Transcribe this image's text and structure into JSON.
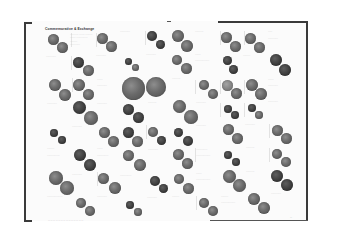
{
  "page": {
    "title": "Commemorative & Exchange",
    "footer": "— — — — — — — — — — — — — —",
    "page_number": "—"
  },
  "coins": [
    {
      "x": 48,
      "y": 34,
      "d": 11,
      "tone": "mid"
    },
    {
      "x": 57,
      "y": 42,
      "d": 11,
      "tone": "mid"
    },
    {
      "x": 97,
      "y": 33,
      "d": 11,
      "tone": "mid"
    },
    {
      "x": 106,
      "y": 41,
      "d": 11,
      "tone": "mid"
    },
    {
      "x": 147,
      "y": 31,
      "d": 10,
      "tone": "dark"
    },
    {
      "x": 156,
      "y": 40,
      "d": 9,
      "tone": "dark"
    },
    {
      "x": 172,
      "y": 30,
      "d": 12,
      "tone": "mid"
    },
    {
      "x": 181,
      "y": 40,
      "d": 12,
      "tone": "mid"
    },
    {
      "x": 221,
      "y": 32,
      "d": 11,
      "tone": "mid"
    },
    {
      "x": 230,
      "y": 41,
      "d": 11,
      "tone": "mid"
    },
    {
      "x": 245,
      "y": 33,
      "d": 11,
      "tone": "mid"
    },
    {
      "x": 254,
      "y": 42,
      "d": 11,
      "tone": "mid"
    },
    {
      "x": 73,
      "y": 57,
      "d": 11,
      "tone": "dark"
    },
    {
      "x": 83,
      "y": 65,
      "d": 11,
      "tone": "mid"
    },
    {
      "x": 125,
      "y": 58,
      "d": 7,
      "tone": "dark"
    },
    {
      "x": 132,
      "y": 64,
      "d": 7,
      "tone": "mid"
    },
    {
      "x": 172,
      "y": 55,
      "d": 10,
      "tone": "mid"
    },
    {
      "x": 181,
      "y": 63,
      "d": 11,
      "tone": "mid"
    },
    {
      "x": 223,
      "y": 56,
      "d": 9,
      "tone": "dark"
    },
    {
      "x": 229,
      "y": 65,
      "d": 9,
      "tone": "dark"
    },
    {
      "x": 270,
      "y": 54,
      "d": 12,
      "tone": "dark"
    },
    {
      "x": 279,
      "y": 64,
      "d": 12,
      "tone": "dark"
    },
    {
      "x": 49,
      "y": 79,
      "d": 12,
      "tone": "mid"
    },
    {
      "x": 59,
      "y": 89,
      "d": 12,
      "tone": "mid"
    },
    {
      "x": 73,
      "y": 79,
      "d": 12,
      "tone": "mid"
    },
    {
      "x": 83,
      "y": 89,
      "d": 11,
      "tone": "mid"
    },
    {
      "x": 122,
      "y": 77,
      "d": 23,
      "tone": "mid"
    },
    {
      "x": 146,
      "y": 77,
      "d": 20,
      "tone": "mid"
    },
    {
      "x": 199,
      "y": 80,
      "d": 10,
      "tone": "mid"
    },
    {
      "x": 208,
      "y": 89,
      "d": 10,
      "tone": "mid"
    },
    {
      "x": 222,
      "y": 80,
      "d": 11,
      "tone": "light"
    },
    {
      "x": 231,
      "y": 88,
      "d": 11,
      "tone": "mid"
    },
    {
      "x": 246,
      "y": 79,
      "d": 12,
      "tone": "mid"
    },
    {
      "x": 255,
      "y": 88,
      "d": 12,
      "tone": "mid"
    },
    {
      "x": 73,
      "y": 101,
      "d": 13,
      "tone": "dark"
    },
    {
      "x": 84,
      "y": 111,
      "d": 14,
      "tone": "mid"
    },
    {
      "x": 123,
      "y": 104,
      "d": 11,
      "tone": "dark"
    },
    {
      "x": 133,
      "y": 112,
      "d": 11,
      "tone": "dark"
    },
    {
      "x": 173,
      "y": 100,
      "d": 13,
      "tone": "mid"
    },
    {
      "x": 184,
      "y": 110,
      "d": 14,
      "tone": "mid"
    },
    {
      "x": 224,
      "y": 105,
      "d": 8,
      "tone": "dark"
    },
    {
      "x": 231,
      "y": 111,
      "d": 8,
      "tone": "dark"
    },
    {
      "x": 248,
      "y": 104,
      "d": 8,
      "tone": "dark"
    },
    {
      "x": 255,
      "y": 111,
      "d": 8,
      "tone": "mid"
    },
    {
      "x": 50,
      "y": 129,
      "d": 8,
      "tone": "dark"
    },
    {
      "x": 58,
      "y": 136,
      "d": 8,
      "tone": "dark"
    },
    {
      "x": 99,
      "y": 127,
      "d": 11,
      "tone": "mid"
    },
    {
      "x": 108,
      "y": 136,
      "d": 11,
      "tone": "mid"
    },
    {
      "x": 123,
      "y": 127,
      "d": 11,
      "tone": "dark"
    },
    {
      "x": 132,
      "y": 136,
      "d": 11,
      "tone": "mid"
    },
    {
      "x": 148,
      "y": 127,
      "d": 10,
      "tone": "mid"
    },
    {
      "x": 157,
      "y": 136,
      "d": 9,
      "tone": "dark"
    },
    {
      "x": 174,
      "y": 128,
      "d": 9,
      "tone": "dark"
    },
    {
      "x": 183,
      "y": 136,
      "d": 10,
      "tone": "dark"
    },
    {
      "x": 223,
      "y": 124,
      "d": 11,
      "tone": "mid"
    },
    {
      "x": 232,
      "y": 133,
      "d": 11,
      "tone": "mid"
    },
    {
      "x": 272,
      "y": 125,
      "d": 11,
      "tone": "mid"
    },
    {
      "x": 281,
      "y": 133,
      "d": 11,
      "tone": "mid"
    },
    {
      "x": 74,
      "y": 149,
      "d": 12,
      "tone": "dark"
    },
    {
      "x": 84,
      "y": 159,
      "d": 12,
      "tone": "dark"
    },
    {
      "x": 123,
      "y": 150,
      "d": 11,
      "tone": "mid"
    },
    {
      "x": 134,
      "y": 159,
      "d": 12,
      "tone": "mid"
    },
    {
      "x": 173,
      "y": 149,
      "d": 11,
      "tone": "mid"
    },
    {
      "x": 182,
      "y": 158,
      "d": 11,
      "tone": "mid"
    },
    {
      "x": 224,
      "y": 151,
      "d": 8,
      "tone": "dark"
    },
    {
      "x": 232,
      "y": 158,
      "d": 8,
      "tone": "dark"
    },
    {
      "x": 272,
      "y": 149,
      "d": 10,
      "tone": "mid"
    },
    {
      "x": 281,
      "y": 157,
      "d": 10,
      "tone": "mid"
    },
    {
      "x": 49,
      "y": 171,
      "d": 14,
      "tone": "mid"
    },
    {
      "x": 60,
      "y": 181,
      "d": 14,
      "tone": "mid"
    },
    {
      "x": 98,
      "y": 173,
      "d": 11,
      "tone": "mid"
    },
    {
      "x": 109,
      "y": 182,
      "d": 12,
      "tone": "mid"
    },
    {
      "x": 150,
      "y": 176,
      "d": 10,
      "tone": "dark"
    },
    {
      "x": 159,
      "y": 184,
      "d": 9,
      "tone": "dark"
    },
    {
      "x": 174,
      "y": 174,
      "d": 10,
      "tone": "mid"
    },
    {
      "x": 183,
      "y": 183,
      "d": 11,
      "tone": "mid"
    },
    {
      "x": 223,
      "y": 170,
      "d": 13,
      "tone": "mid"
    },
    {
      "x": 233,
      "y": 179,
      "d": 13,
      "tone": "mid"
    },
    {
      "x": 271,
      "y": 170,
      "d": 12,
      "tone": "dark"
    },
    {
      "x": 281,
      "y": 179,
      "d": 12,
      "tone": "dark"
    },
    {
      "x": 76,
      "y": 198,
      "d": 10,
      "tone": "mid"
    },
    {
      "x": 85,
      "y": 206,
      "d": 10,
      "tone": "mid"
    },
    {
      "x": 126,
      "y": 201,
      "d": 8,
      "tone": "dark"
    },
    {
      "x": 134,
      "y": 208,
      "d": 8,
      "tone": "mid"
    },
    {
      "x": 199,
      "y": 198,
      "d": 10,
      "tone": "mid"
    },
    {
      "x": 208,
      "y": 206,
      "d": 10,
      "tone": "mid"
    },
    {
      "x": 248,
      "y": 193,
      "d": 12,
      "tone": "mid"
    },
    {
      "x": 258,
      "y": 202,
      "d": 12,
      "tone": "mid"
    }
  ],
  "labels": [
    {
      "x": 70,
      "y": 33,
      "text": "────── ──── ─────"
    },
    {
      "x": 70,
      "y": 36,
      "text": "──── ────────"
    },
    {
      "x": 70,
      "y": 40,
      "text": "─────"
    },
    {
      "x": 70,
      "y": 43,
      "text": "───────"
    },
    {
      "x": 46,
      "y": 55,
      "text": "───────"
    },
    {
      "x": 96,
      "y": 54,
      "text": "───────"
    },
    {
      "x": 120,
      "y": 30,
      "text": "───────"
    },
    {
      "x": 146,
      "y": 53,
      "text": "───────"
    },
    {
      "x": 195,
      "y": 30,
      "text": "──────"
    },
    {
      "x": 195,
      "y": 53,
      "text": "────"
    },
    {
      "x": 195,
      "y": 59,
      "text": "──────────"
    },
    {
      "x": 243,
      "y": 54,
      "text": "─────"
    },
    {
      "x": 268,
      "y": 30,
      "text": "───"
    },
    {
      "x": 268,
      "y": 37,
      "text": "───────"
    },
    {
      "x": 172,
      "y": 77,
      "text": "──────"
    },
    {
      "x": 97,
      "y": 78,
      "text": "────"
    },
    {
      "x": 97,
      "y": 84,
      "text": "───────"
    },
    {
      "x": 268,
      "y": 78,
      "text": "────"
    },
    {
      "x": 268,
      "y": 84,
      "text": "───────"
    },
    {
      "x": 47,
      "y": 102,
      "text": "───────"
    },
    {
      "x": 97,
      "y": 102,
      "text": "───────"
    },
    {
      "x": 148,
      "y": 101,
      "text": "──────"
    },
    {
      "x": 196,
      "y": 101,
      "text": "───────"
    },
    {
      "x": 268,
      "y": 100,
      "text": "───────"
    },
    {
      "x": 72,
      "y": 125,
      "text": "───────"
    },
    {
      "x": 196,
      "y": 124,
      "text": "───────"
    },
    {
      "x": 245,
      "y": 123,
      "text": "───────"
    },
    {
      "x": 47,
      "y": 147,
      "text": "─────"
    },
    {
      "x": 47,
      "y": 154,
      "text": "─────────"
    },
    {
      "x": 97,
      "y": 147,
      "text": "────"
    },
    {
      "x": 97,
      "y": 154,
      "text": "────────"
    },
    {
      "x": 148,
      "y": 148,
      "text": "───────"
    },
    {
      "x": 196,
      "y": 148,
      "text": "────────"
    },
    {
      "x": 196,
      "y": 154,
      "text": "──────────"
    },
    {
      "x": 246,
      "y": 146,
      "text": "──────"
    },
    {
      "x": 72,
      "y": 173,
      "text": "───────"
    },
    {
      "x": 120,
      "y": 174,
      "text": "────────"
    },
    {
      "x": 196,
      "y": 172,
      "text": "────"
    },
    {
      "x": 196,
      "y": 178,
      "text": "──────────"
    },
    {
      "x": 246,
      "y": 170,
      "text": "──────"
    },
    {
      "x": 47,
      "y": 195,
      "text": "───────────"
    },
    {
      "x": 97,
      "y": 195,
      "text": "───────"
    },
    {
      "x": 147,
      "y": 196,
      "text": "───────"
    },
    {
      "x": 172,
      "y": 195,
      "text": "─────"
    },
    {
      "x": 221,
      "y": 195,
      "text": "─────"
    },
    {
      "x": 221,
      "y": 201,
      "text": "──────────"
    },
    {
      "x": 271,
      "y": 192,
      "text": "───────"
    }
  ],
  "separators": [
    {
      "x": 71,
      "y": 33,
      "h": 14
    },
    {
      "x": 96,
      "y": 33,
      "h": 14
    },
    {
      "x": 145,
      "y": 31,
      "h": 14
    },
    {
      "x": 220,
      "y": 31,
      "h": 14
    },
    {
      "x": 244,
      "y": 31,
      "h": 14
    },
    {
      "x": 71,
      "y": 56,
      "h": 14
    },
    {
      "x": 195,
      "y": 80,
      "h": 14
    },
    {
      "x": 220,
      "y": 80,
      "h": 14
    },
    {
      "x": 244,
      "y": 80,
      "h": 14
    },
    {
      "x": 72,
      "y": 78,
      "h": 14
    },
    {
      "x": 220,
      "y": 103,
      "h": 14
    },
    {
      "x": 244,
      "y": 103,
      "h": 14
    },
    {
      "x": 146,
      "y": 125,
      "h": 14
    },
    {
      "x": 269,
      "y": 124,
      "h": 14
    },
    {
      "x": 195,
      "y": 148,
      "h": 14
    },
    {
      "x": 269,
      "y": 148,
      "h": 14
    },
    {
      "x": 97,
      "y": 172,
      "h": 14
    },
    {
      "x": 196,
      "y": 196,
      "h": 14
    }
  ]
}
